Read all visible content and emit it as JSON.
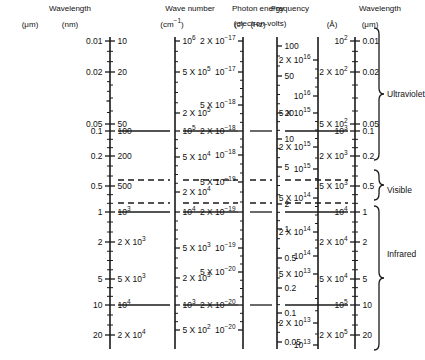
{
  "figure": {
    "width": 413,
    "height": 360,
    "line_color": "#1a1a1a",
    "background": "#ffffff"
  },
  "headers": [
    {
      "name": "wavelength-header",
      "title": "Wavelength",
      "units": [
        "(μm)",
        "(nm)"
      ]
    },
    {
      "name": "frequency-header",
      "title": "Frequency",
      "units": [
        "(Hz)"
      ]
    },
    {
      "name": "wavenumber-header",
      "title": "Wave number",
      "units": [
        "(cm⁻¹)"
      ]
    },
    {
      "name": "photon-energy-header",
      "title": "Photon energy",
      "units": [
        "(J)",
        "(electron-volts)"
      ]
    },
    {
      "name": "wavelength-right-header",
      "title": "Wavelength",
      "units": [
        "(Å)",
        "(μm)"
      ]
    }
  ],
  "bands": [
    {
      "label": "Ultraviolet",
      "y": 94
    },
    {
      "label": "Visible",
      "y": 190
    },
    {
      "label": "Infrared",
      "y": 254
    }
  ],
  "chart_data": {
    "type": "table",
    "axis_orientation": "vertical logarithmic",
    "scales": [
      {
        "name": "wavelength-um",
        "header": "Wavelength",
        "unit": "(μm)",
        "side": "left",
        "x": 110,
        "top": 41,
        "bottom": 345,
        "ticks": [
          {
            "value": "0.01",
            "y": 41,
            "major": true
          },
          {
            "value": "0.02",
            "y": 72,
            "major": true
          },
          {
            "value": "",
            "y": 101,
            "major": false
          },
          {
            "value": "0.05",
            "y": 124,
            "major": true
          },
          {
            "value": "0.1",
            "y": 131,
            "major": true
          },
          {
            "value": "0.2",
            "y": 156,
            "major": true
          },
          {
            "value": "0.5",
            "y": 186,
            "major": true
          },
          {
            "value": "1",
            "y": 212,
            "major": true
          },
          {
            "value": "2",
            "y": 242,
            "major": true
          },
          {
            "value": "5",
            "y": 279,
            "major": true
          },
          {
            "value": "10",
            "y": 305,
            "major": true
          },
          {
            "value": "20",
            "y": 335,
            "major": true
          }
        ]
      },
      {
        "name": "wavelength-nm",
        "header": "Wavelength",
        "unit": "(nm)",
        "side": "right",
        "x": 110,
        "ticks": [
          {
            "value": "10",
            "y": 41
          },
          {
            "value": "20",
            "y": 72
          },
          {
            "value": "50",
            "y": 124
          },
          {
            "value": "100",
            "y": 131
          },
          {
            "value": "200",
            "y": 156
          },
          {
            "value": "500",
            "y": 186
          },
          {
            "value": "10³",
            "y": 212
          },
          {
            "value": "2 X 10³",
            "y": 242
          },
          {
            "value": "5 X 10³",
            "y": 279
          },
          {
            "value": "10⁴",
            "y": 305
          },
          {
            "value": "2 X 10⁴",
            "y": 335
          }
        ]
      },
      {
        "name": "frequency-hz",
        "header": "Frequency",
        "unit": "(Hz)",
        "side": "left",
        "x": 318,
        "top": 41,
        "bottom": 345,
        "ticks": [
          {
            "value": "2 X 10¹⁶",
            "y": 60
          },
          {
            "value": "10¹⁶",
            "y": 96
          },
          {
            "value": "5 X 10¹⁵",
            "y": 113
          },
          {
            "value": "2 X 10¹⁵",
            "y": 147
          },
          {
            "value": "10¹⁵",
            "y": 169
          },
          {
            "value": "5 X 10¹⁴",
            "y": 198
          },
          {
            "value": "2 X 10¹⁴",
            "y": 232
          },
          {
            "value": "10¹⁴",
            "y": 256
          },
          {
            "value": "5 X 10¹³",
            "y": 274
          },
          {
            "value": "2 X 10¹³",
            "y": 323
          },
          {
            "value": "10¹³",
            "y": 345
          }
        ]
      },
      {
        "name": "wavenumber-cm1",
        "header": "Wave number",
        "unit": "(cm⁻¹)",
        "side": "right",
        "x": 175,
        "top": 41,
        "bottom": 345,
        "ticks": [
          {
            "value": "10⁶",
            "y": 41
          },
          {
            "value": "5 X 10⁵",
            "y": 72
          },
          {
            "value": "2 X 10⁵",
            "y": 113
          },
          {
            "value": "10⁵",
            "y": 131
          },
          {
            "value": "5 X 10⁴",
            "y": 157
          },
          {
            "value": "2 X 10⁴",
            "y": 192
          },
          {
            "value": "10⁴",
            "y": 212
          },
          {
            "value": "5 X 10³",
            "y": 248
          },
          {
            "value": "2 X 10³",
            "y": 278
          },
          {
            "value": "10³",
            "y": 305
          },
          {
            "value": "5 X 10²",
            "y": 330
          }
        ]
      },
      {
        "name": "photon-energy-joules",
        "header": "Photon energy",
        "unit": "(J)",
        "side": "left",
        "x": 243,
        "top": 41,
        "bottom": 345,
        "ticks": [
          {
            "value": "2 X 10⁻¹⁷",
            "y": 41
          },
          {
            "value": "10⁻¹⁷",
            "y": 72
          },
          {
            "value": "5 X 10⁻¹⁸",
            "y": 105
          },
          {
            "value": "2 X 10⁻¹⁸",
            "y": 131
          },
          {
            "value": "10⁻¹⁸",
            "y": 155
          },
          {
            "value": "5 X 10⁻¹⁹",
            "y": 182
          },
          {
            "value": "2 X 10⁻¹⁹",
            "y": 212
          },
          {
            "value": "10⁻¹⁹",
            "y": 248
          },
          {
            "value": "5 X 10⁻²⁰",
            "y": 272
          },
          {
            "value": "2 X 10⁻²⁰",
            "y": 305
          },
          {
            "value": "10⁻²⁰",
            "y": 330
          }
        ]
      },
      {
        "name": "photon-energy-ev",
        "header": "Photon energy",
        "unit": "(electron-volts)",
        "side": "right",
        "x": 277,
        "top": 41,
        "bottom": 345,
        "ticks": [
          {
            "value": "100",
            "y": 46
          },
          {
            "value": "50",
            "y": 76
          },
          {
            "value": "20",
            "y": 113
          },
          {
            "value": "10",
            "y": 139
          },
          {
            "value": "5",
            "y": 167
          },
          {
            "value": "2",
            "y": 204
          },
          {
            "value": "1",
            "y": 229
          },
          {
            "value": "0.5",
            "y": 258
          },
          {
            "value": "0.2",
            "y": 288
          },
          {
            "value": "0.1",
            "y": 313
          },
          {
            "value": "0.05",
            "y": 342
          }
        ]
      },
      {
        "name": "wavelength-angstrom",
        "header": "Wavelength",
        "unit": "(Å)",
        "side": "left",
        "x": 355,
        "top": 41,
        "bottom": 345,
        "ticks": [
          {
            "value": "10²",
            "y": 41
          },
          {
            "value": "2 X 10²",
            "y": 72
          },
          {
            "value": "5 X 10²",
            "y": 124
          },
          {
            "value": "10³",
            "y": 131
          },
          {
            "value": "2 X 10³",
            "y": 156
          },
          {
            "value": "5 X 10³",
            "y": 186
          },
          {
            "value": "10⁴",
            "y": 212
          },
          {
            "value": "2 X 10⁴",
            "y": 242
          },
          {
            "value": "5 X 10⁴",
            "y": 279
          },
          {
            "value": "10⁵",
            "y": 305
          },
          {
            "value": "2 X 10⁵",
            "y": 335
          }
        ]
      },
      {
        "name": "wavelength-right-um",
        "header": "Wavelength",
        "unit": "(μm)",
        "side": "right",
        "x": 355,
        "ticks": [
          {
            "value": "0.01",
            "y": 41
          },
          {
            "value": "0.02",
            "y": 72
          },
          {
            "value": "0.05",
            "y": 124
          },
          {
            "value": "0.1",
            "y": 131
          },
          {
            "value": "0.2",
            "y": 156
          },
          {
            "value": "0.5",
            "y": 186
          },
          {
            "value": "1",
            "y": 212
          },
          {
            "value": "2",
            "y": 242
          },
          {
            "value": "5",
            "y": 279
          },
          {
            "value": "10",
            "y": 305
          },
          {
            "value": "20",
            "y": 335
          }
        ]
      }
    ],
    "connector_lines": [
      {
        "name": "line-0.1um",
        "y": 131,
        "style": "solid",
        "label": "0.1 μm"
      },
      {
        "name": "line-violet-limit",
        "y": 180,
        "style": "dashed",
        "label": "visible upper limit"
      },
      {
        "name": "line-red-limit",
        "y": 203,
        "style": "dashed",
        "label": "visible lower limit"
      },
      {
        "name": "line-1um",
        "y": 212,
        "style": "solid",
        "label": "1 μm"
      },
      {
        "name": "line-10um",
        "y": 305,
        "style": "solid",
        "label": "10 μm"
      }
    ]
  }
}
